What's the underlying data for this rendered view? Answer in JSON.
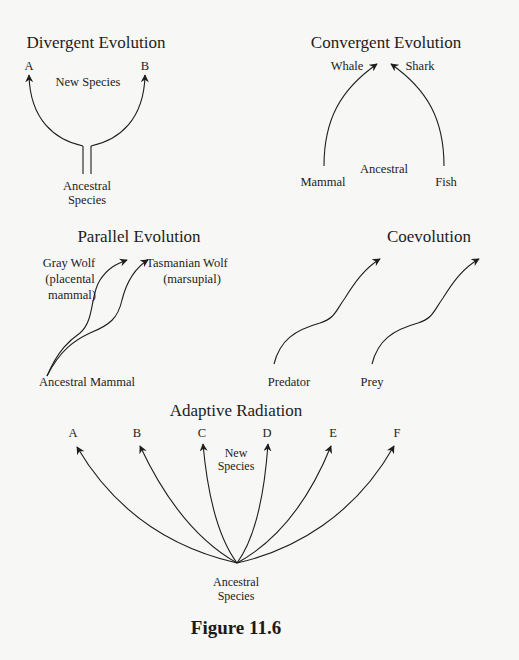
{
  "figure": {
    "caption": "Figure 11.6",
    "panels": {
      "divergent": {
        "title": "Divergent Evolution",
        "new_species_label": "New Species",
        "species": [
          "A",
          "B"
        ],
        "ancestor_line1": "Ancestral",
        "ancestor_line2": "Species"
      },
      "convergent": {
        "title": "Convergent Evolution",
        "targets": [
          "Whale",
          "Shark"
        ],
        "ancestral_label": "Ancestral",
        "origins": [
          "Mammal",
          "Fish"
        ]
      },
      "parallel": {
        "title": "Parallel Evolution",
        "gray_wolf_line1": "Gray Wolf",
        "gray_wolf_line2": "(placental",
        "gray_wolf_line3": "mammal)",
        "tasmanian_wolf_line1": "Tasmanian Wolf",
        "tasmanian_wolf_line2": "(marsupial)",
        "ancestor": "Ancestral Mammal"
      },
      "coevolution": {
        "title": "Coevolution",
        "lineages": [
          "Predator",
          "Prey"
        ]
      },
      "adaptive_radiation": {
        "title": "Adaptive Radiation",
        "species": [
          "A",
          "B",
          "C",
          "D",
          "E",
          "F"
        ],
        "new_species_line1": "New",
        "new_species_line2": "Species",
        "ancestor_line1": "Ancestral",
        "ancestor_line2": "Species"
      }
    },
    "colors": {
      "background": "#f7f7f5",
      "ink": "#1e1e1e"
    }
  }
}
